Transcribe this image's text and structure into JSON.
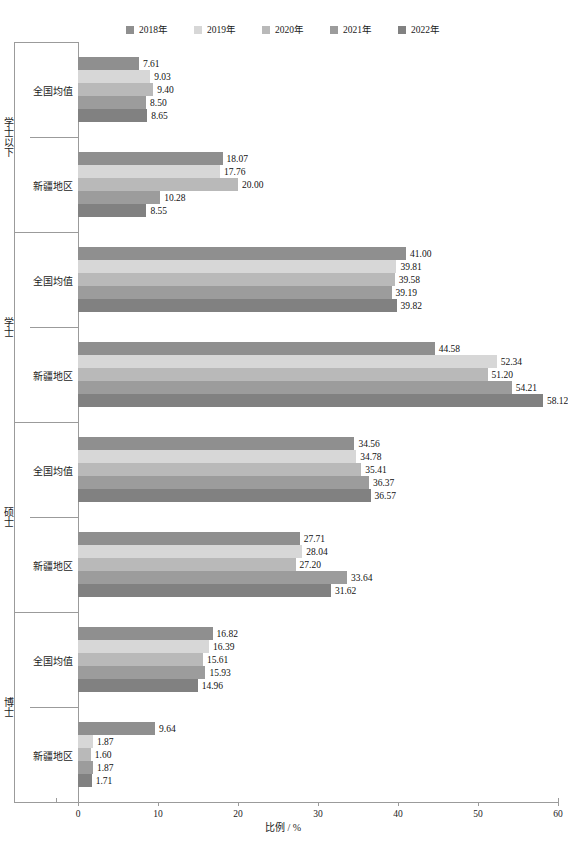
{
  "chart_data": {
    "type": "bar",
    "orientation": "horizontal",
    "title": "",
    "xlabel": "比例 / %",
    "ylabel": "",
    "xlim": [
      0,
      60
    ],
    "xticks": [
      "0",
      "10",
      "20",
      "30",
      "40",
      "50",
      "60"
    ],
    "grid": false,
    "legend_position": "top-center",
    "series": [
      {
        "name": "2018年",
        "color": "#8f8f8f"
      },
      {
        "name": "2019年",
        "color": "#d7d7d7"
      },
      {
        "name": "2020年",
        "color": "#b9b9b9"
      },
      {
        "name": "2021年",
        "color": "#9c9c9c"
      },
      {
        "name": "2022年",
        "color": "#818181"
      }
    ],
    "groups": [
      {
        "name": "学士以下",
        "subgroups": [
          {
            "name": "全国均值",
            "values": [
              7.61,
              9.03,
              9.4,
              8.5,
              8.65
            ],
            "labels": [
              "7.61",
              "9.03",
              "9.40",
              "8.50",
              "8.65"
            ]
          },
          {
            "name": "新疆地区",
            "values": [
              18.07,
              17.76,
              20.0,
              10.28,
              8.55
            ],
            "labels": [
              "18.07",
              "17.76",
              "20.00",
              "10.28",
              "8.55"
            ]
          }
        ]
      },
      {
        "name": "学士",
        "subgroups": [
          {
            "name": "全国均值",
            "values": [
              41.0,
              39.81,
              39.58,
              39.19,
              39.82
            ],
            "labels": [
              "41.00",
              "39.81",
              "39.58",
              "39.19",
              "39.82"
            ]
          },
          {
            "name": "新疆地区",
            "values": [
              44.58,
              52.34,
              51.2,
              54.21,
              58.12
            ],
            "labels": [
              "44.58",
              "52.34",
              "51.20",
              "54.21",
              "58.12"
            ]
          }
        ]
      },
      {
        "name": "硕士",
        "subgroups": [
          {
            "name": "全国均值",
            "values": [
              34.56,
              34.78,
              35.41,
              36.37,
              36.57
            ],
            "labels": [
              "34.56",
              "34.78",
              "35.41",
              "36.37",
              "36.57"
            ]
          },
          {
            "name": "新疆地区",
            "values": [
              27.71,
              28.04,
              27.2,
              33.64,
              31.62
            ],
            "labels": [
              "27.71",
              "28.04",
              "27.20",
              "33.64",
              "31.62"
            ]
          }
        ]
      },
      {
        "name": "博士",
        "subgroups": [
          {
            "name": "全国均值",
            "values": [
              16.82,
              16.39,
              15.61,
              15.93,
              14.96
            ],
            "labels": [
              "16.82",
              "16.39",
              "15.61",
              "15.93",
              "14.96"
            ]
          },
          {
            "name": "新疆地区",
            "values": [
              9.64,
              1.87,
              1.6,
              1.87,
              1.71
            ],
            "labels": [
              "9.64",
              "1.87",
              "1.60",
              "1.87",
              "1.71"
            ]
          }
        ]
      }
    ]
  }
}
